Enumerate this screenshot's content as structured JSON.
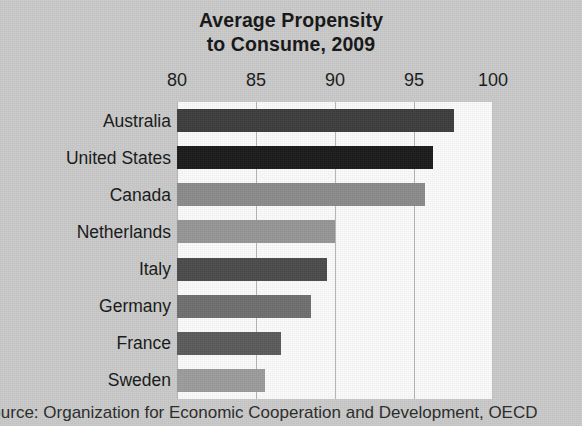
{
  "chart_data": {
    "type": "bar",
    "orientation": "horizontal",
    "title": "Average Propensity to Consume, 2009",
    "title_lines": [
      "Average Propensity",
      "to Consume, 2009"
    ],
    "xlabel": "",
    "ylabel": "",
    "xlim": [
      80,
      100
    ],
    "xticks": [
      80,
      85,
      90,
      95,
      100
    ],
    "xtick_labels": [
      "80",
      "85",
      "90",
      "95",
      "100"
    ],
    "grid": true,
    "legend": "none",
    "categories": [
      "Australia",
      "United States",
      "Canada",
      "Netherlands",
      "Italy",
      "Germany",
      "France",
      "Sweden"
    ],
    "values": [
      97.5,
      96.2,
      95.7,
      90.0,
      89.5,
      88.5,
      86.6,
      85.6
    ],
    "bar_colors": [
      "#3d3d3d",
      "#1b1b1b",
      "#8b8b8b",
      "#969696",
      "#4b4b4b",
      "#6f6f6f",
      "#5b5b5b",
      "#9c9c9c"
    ],
    "bars": [
      {
        "label": "Australia",
        "value": 97.5,
        "color": "#3d3d3d"
      },
      {
        "label": "United States",
        "value": 96.2,
        "color": "#1b1b1b"
      },
      {
        "label": "Canada",
        "value": 95.7,
        "color": "#8b8b8b"
      },
      {
        "label": "Netherlands",
        "value": 90.0,
        "color": "#969696"
      },
      {
        "label": "Italy",
        "value": 89.5,
        "color": "#4b4b4b"
      },
      {
        "label": "Germany",
        "value": 88.5,
        "color": "#6f6f6f"
      },
      {
        "label": "France",
        "value": 86.6,
        "color": "#5b5b5b"
      },
      {
        "label": "Sweden",
        "value": 85.6,
        "color": "#9c9c9c"
      }
    ],
    "source_note": "Source: Organization for Economic Cooperation and Development, OECD"
  },
  "colors": {
    "page_background": "#c9cac9",
    "plot_background": "#fbfbfb",
    "gridline": "#b6b6b6",
    "text": "#171717"
  }
}
